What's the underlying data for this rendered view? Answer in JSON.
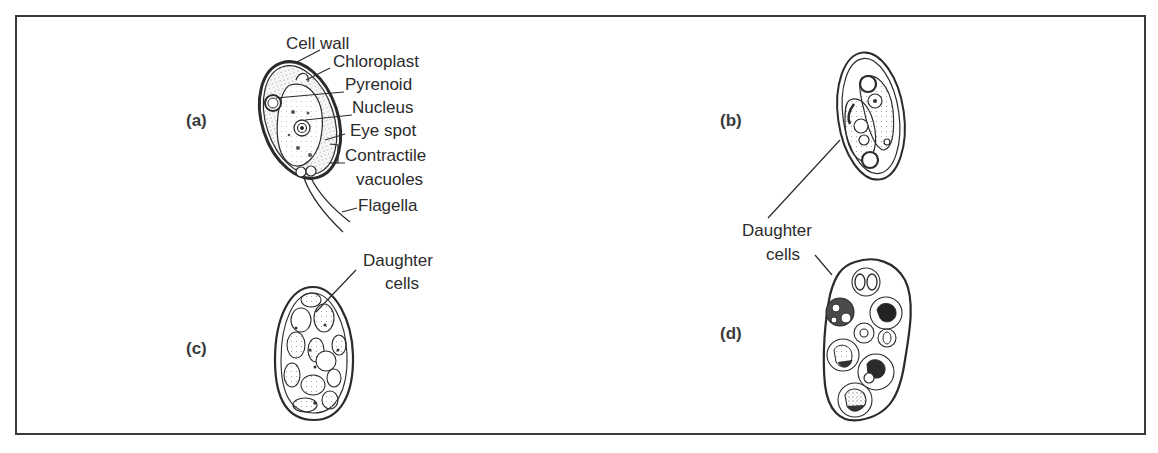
{
  "figure": {
    "panels": [
      {
        "id": "a",
        "label": "(a)",
        "parts": [
          "Cell wall",
          "Chloroplast",
          "Pyrenoid",
          "Nucleus",
          "Eye spot",
          "Contractile",
          "vacuoles",
          "Flagella"
        ]
      },
      {
        "id": "b",
        "label": "(b)"
      },
      {
        "id": "c",
        "label": "(c)",
        "annotation": [
          "Daughter",
          "cells"
        ]
      },
      {
        "id": "d",
        "label": "(d)"
      }
    ],
    "shared_annotation": [
      "Daughter",
      "cells"
    ]
  },
  "colors": {
    "ink": "#2b2b2b",
    "stipple": "#9a9a9a",
    "frame": "#3a3a3a",
    "background": "#ffffff"
  }
}
